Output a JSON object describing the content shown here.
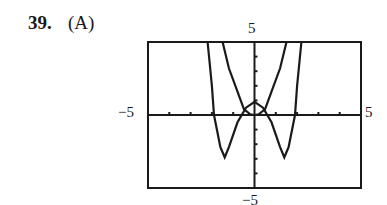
{
  "problem": {
    "number": "39.",
    "choice": "(A)"
  },
  "labels": {
    "ymax": "5",
    "ymin": "−5",
    "xmin": "−5",
    "xmax": "5"
  },
  "chart_data": {
    "type": "line",
    "title": "",
    "xlabel": "",
    "ylabel": "",
    "xlim": [
      -5,
      5
    ],
    "ylim": [
      -5,
      5
    ],
    "grid": false,
    "ticks": {
      "x_step": 1,
      "y_step": 1
    },
    "series": [
      {
        "name": "curve 1 (W-shaped quartic)",
        "points": [
          [
            -2.2,
            5
          ],
          [
            -2,
            2.0
          ],
          [
            -1.9,
            0
          ],
          [
            -1.6,
            -2.2
          ],
          [
            -1.4,
            -2.9
          ],
          [
            -1.2,
            -2.2
          ],
          [
            -0.8,
            -0.5
          ],
          [
            -0.4,
            0.5
          ],
          [
            0,
            0.9
          ],
          [
            0.4,
            0.5
          ],
          [
            0.8,
            -0.5
          ],
          [
            1.2,
            -2.2
          ],
          [
            1.4,
            -2.9
          ],
          [
            1.6,
            -2.2
          ],
          [
            1.9,
            0
          ],
          [
            2,
            2.0
          ],
          [
            2.2,
            5
          ]
        ]
      },
      {
        "name": "curve 2 (U-shaped)",
        "points": [
          [
            -1.5,
            5
          ],
          [
            -1.2,
            3.2
          ],
          [
            -0.8,
            1.6
          ],
          [
            -0.5,
            0.4
          ],
          [
            -0.2,
            0.05
          ],
          [
            0,
            0
          ],
          [
            0.2,
            0.05
          ],
          [
            0.5,
            0.4
          ],
          [
            0.8,
            1.6
          ],
          [
            1.2,
            3.2
          ],
          [
            1.5,
            5
          ]
        ]
      }
    ]
  }
}
